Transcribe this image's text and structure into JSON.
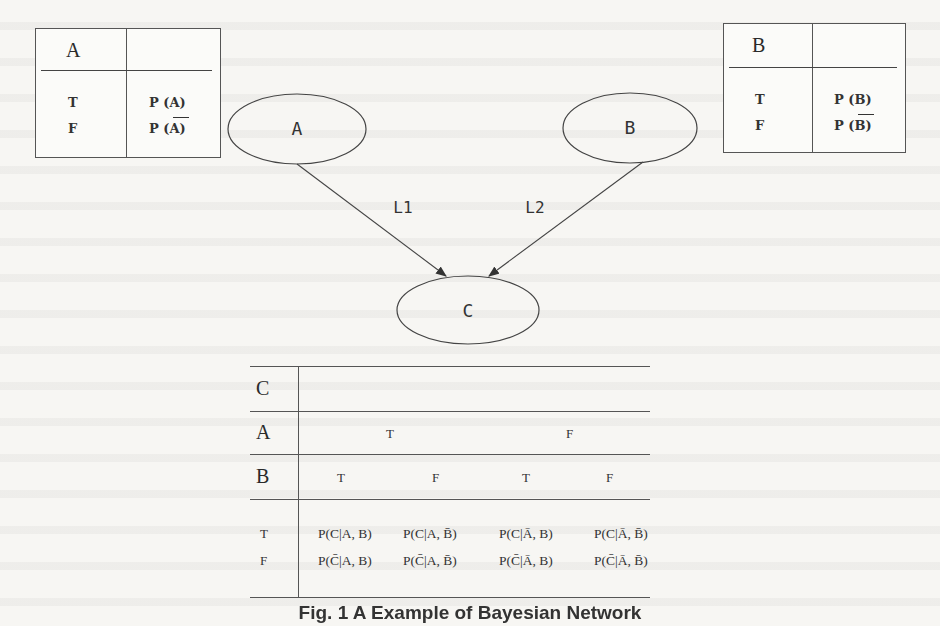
{
  "figure": {
    "caption": "Fig. 1 A Example of Bayesian Network"
  },
  "nodes": [
    {
      "id": "A",
      "label": "A"
    },
    {
      "id": "B",
      "label": "B"
    },
    {
      "id": "C",
      "label": "C"
    }
  ],
  "edges": [
    {
      "from": "A",
      "to": "C",
      "label": "L1"
    },
    {
      "from": "B",
      "to": "C",
      "label": "L2"
    }
  ],
  "table_a": {
    "header": "A",
    "rows": [
      {
        "state": "T",
        "prob": "P (A)",
        "negated": false
      },
      {
        "state": "F",
        "prob": "P (A)",
        "negated": true
      }
    ]
  },
  "table_b": {
    "header": "B",
    "rows": [
      {
        "state": "T",
        "prob": "P (B)",
        "negated": false
      },
      {
        "state": "F",
        "prob": "P (B)",
        "negated": true
      }
    ]
  },
  "table_c": {
    "row_labels": [
      "C",
      "A",
      "B"
    ],
    "a_values": [
      "T",
      "F"
    ],
    "b_values": [
      "T",
      "F",
      "T",
      "F"
    ],
    "c_states": [
      "T",
      "F"
    ],
    "true_row": [
      "P(C|A, B)",
      "P(C|A, B̄)",
      "P(C|Ā, B)",
      "P(C|Ā, B̄)"
    ],
    "false_row": [
      "P(C̄|A, B)",
      "P(C̄|A, B̄)",
      "P(C̄|Ā, B)",
      "P(C̄|Ā, B̄)"
    ]
  }
}
